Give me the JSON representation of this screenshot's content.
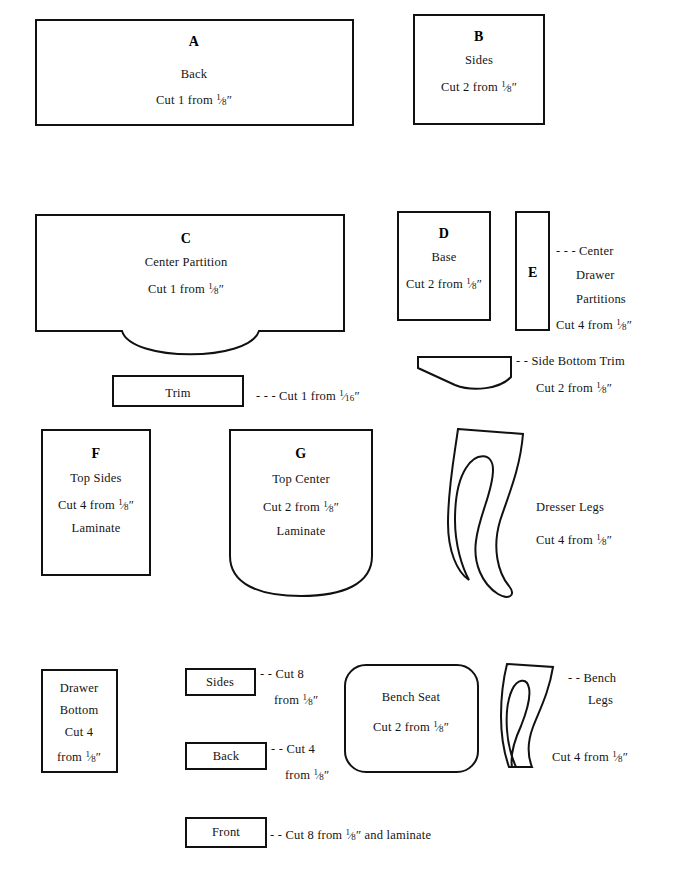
{
  "document": {
    "title": "Dresser and Bench Cutting Pattern Sheet",
    "kind": "woodworking cutting diagram",
    "background_color": "#ffffff",
    "line_color": "#111111"
  },
  "parts": {
    "a": {
      "letter": "A",
      "name": "Back",
      "cut": "Cut 1 from ",
      "thickness_num": "1",
      "thickness_den": "8",
      "thickness_unit": "″"
    },
    "b": {
      "letter": "B",
      "name": "Sides",
      "cut": "Cut 2 from ",
      "thickness_num": "1",
      "thickness_den": "8",
      "thickness_unit": "″"
    },
    "c": {
      "letter": "C",
      "name": "Center Partition",
      "cut": "Cut 1 from ",
      "thickness_num": "1",
      "thickness_den": "8",
      "thickness_unit": "″"
    },
    "d": {
      "letter": "D",
      "name": "Base",
      "cut": "Cut 2 from ",
      "thickness_num": "1",
      "thickness_den": "8",
      "thickness_unit": "″"
    },
    "e": {
      "letter": "E",
      "name_line1": "Center",
      "name_line2": "Drawer",
      "name_line3": "Partitions",
      "leader": "- - - ",
      "cut": "Cut 4 from ",
      "thickness_num": "1",
      "thickness_den": "8",
      "thickness_unit": "″"
    },
    "f": {
      "letter": "F",
      "name": "Top Sides",
      "cut": "Cut 4 from ",
      "thickness_num": "1",
      "thickness_den": "8",
      "thickness_unit": "″",
      "extra": "Laminate"
    },
    "g": {
      "letter": "G",
      "name": "Top Center",
      "cut": "Cut 2 from ",
      "thickness_num": "1",
      "thickness_den": "8",
      "thickness_unit": "″",
      "extra": "Laminate"
    },
    "trim": {
      "name": "Trim",
      "leader": "- - - ",
      "cut": "Cut 1 from ",
      "thickness_num": "1",
      "thickness_den": "16",
      "thickness_unit": "″"
    },
    "side_bottom_trim": {
      "leader": "- - ",
      "name": "Side Bottom Trim",
      "cut": "Cut 2 from ",
      "thickness_num": "1",
      "thickness_den": "8",
      "thickness_unit": "″"
    },
    "dresser_legs": {
      "name": "Dresser Legs",
      "cut": "Cut 4 from ",
      "thickness_num": "1",
      "thickness_den": "8",
      "thickness_unit": "″"
    },
    "drawer_bottom": {
      "name_line1": "Drawer",
      "name_line2": "Bottom",
      "cut_line1": "Cut 4",
      "cut_line2": "from ",
      "thickness_num": "1",
      "thickness_den": "8",
      "thickness_unit": "″"
    },
    "drawer_sides": {
      "name": "Sides",
      "leader": "- - ",
      "cut_line1": "Cut 8",
      "cut_line2": "from ",
      "thickness_num": "1",
      "thickness_den": "8",
      "thickness_unit": "″"
    },
    "drawer_back": {
      "name": "Back",
      "leader": "- - ",
      "cut_line1": "Cut 4",
      "cut_line2": "from ",
      "thickness_num": "1",
      "thickness_den": "8",
      "thickness_unit": "″"
    },
    "drawer_front": {
      "name": "Front",
      "leader": "- - ",
      "cut_pre": "Cut 8 from ",
      "thickness_num": "1",
      "thickness_den": "8",
      "thickness_unit": "″",
      "cut_post": " and laminate"
    },
    "bench_seat": {
      "name": "Bench Seat",
      "cut": "Cut 2 from ",
      "thickness_num": "1",
      "thickness_den": "8",
      "thickness_unit": "″"
    },
    "bench_legs": {
      "leader": "- - ",
      "name_line1": "Bench",
      "name_line2": "Legs",
      "cut": "Cut 4 from ",
      "thickness_num": "1",
      "thickness_den": "8",
      "thickness_unit": "″"
    }
  }
}
